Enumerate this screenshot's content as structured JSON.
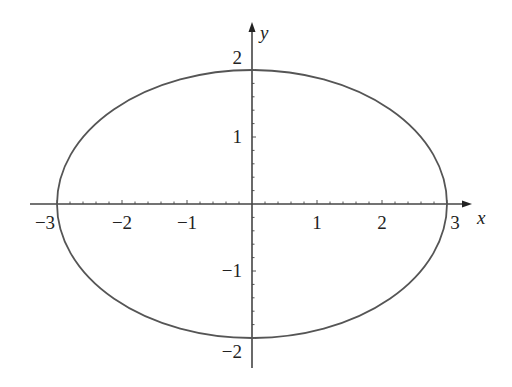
{
  "chart_data": {
    "type": "line",
    "title": "",
    "equation": "x^2/9 + y^2/4 = 1",
    "xlabel": "x",
    "ylabel": "y",
    "xlim": [
      -3.1,
      3.4
    ],
    "ylim": [
      -2.2,
      2.2
    ],
    "grid": false,
    "legend": null,
    "x_ticks": [
      -3,
      -2,
      -1,
      1,
      2,
      3
    ],
    "x_tick_labels": [
      "−3",
      "−2",
      "−1",
      "1",
      "2",
      "3"
    ],
    "y_ticks": [
      2,
      1,
      -1,
      -2
    ],
    "y_tick_labels": [
      "2",
      "1",
      "−1",
      "−2"
    ],
    "minor_tick_step": 0.2,
    "series": [
      {
        "name": "ellipse",
        "semi_major_x": 3,
        "semi_minor_y": 2,
        "center": [
          0,
          0
        ],
        "points": [
          [
            3,
            0
          ],
          [
            2.598,
            1
          ],
          [
            1.5,
            1.732
          ],
          [
            0,
            2
          ],
          [
            -1.5,
            1.732
          ],
          [
            -2.598,
            1
          ],
          [
            -3,
            0
          ],
          [
            -2.598,
            -1
          ],
          [
            -1.5,
            -1.732
          ],
          [
            0,
            -2
          ],
          [
            1.5,
            -1.732
          ],
          [
            2.598,
            -1
          ],
          [
            3,
            0
          ]
        ],
        "color": "#555555"
      }
    ]
  },
  "layout": {
    "origin_px": [
      252,
      204
    ],
    "x_unit_px": 65,
    "y_unit_px": 67,
    "axis_color": "#444444",
    "curve_color": "#555555"
  }
}
